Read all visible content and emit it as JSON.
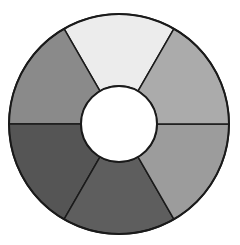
{
  "chart_data": {
    "type": "pie",
    "subtype": "donut",
    "title": "",
    "categories": [
      "Segment 1",
      "Segment 2",
      "Segment 3",
      "Segment 4",
      "Segment 5",
      "Segment 6"
    ],
    "values": [
      1,
      1,
      1,
      1,
      1,
      1
    ],
    "start_angle_deg": 60,
    "direction": "counterclockwise",
    "colors": [
      "#ececec",
      "#8a8a8a",
      "#555555",
      "#5e5e5e",
      "#9c9c9c",
      "#ababab"
    ],
    "legend": "none",
    "labels_shown": false,
    "geometry": {
      "cx": 119,
      "cy": 124,
      "outer_radius": 110,
      "inner_radius": 38,
      "stroke": "#1a1a1a",
      "stroke_width": 1.5
    }
  }
}
